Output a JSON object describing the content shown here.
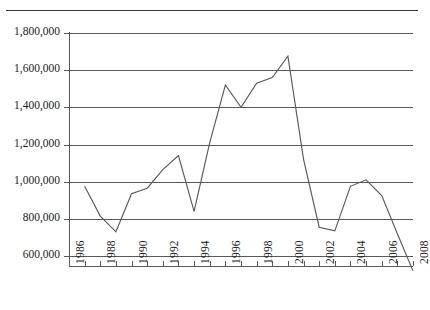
{
  "chart_data": {
    "type": "line",
    "title": "",
    "subtitle": "",
    "xlabel": "",
    "ylabel": "",
    "grid": true,
    "legend": false,
    "legend_position": "none",
    "xlim": [
      1986,
      2008
    ],
    "ylim": [
      450000,
      1800000
    ],
    "x_tick_interval_years": 1,
    "x_label_interval_years": 2,
    "y_tick_labels": [
      "1,800,000",
      "1,600,000",
      "1,400,000",
      "1,200,000",
      "1,000,000",
      "800,000",
      "600,000"
    ],
    "y_tick_values": [
      1800000,
      1600000,
      1400000,
      1200000,
      1000000,
      800000,
      600000
    ],
    "x_tick_labels": [
      "1986",
      "1988",
      "1990",
      "1992",
      "1994",
      "1996",
      "1998",
      "2000",
      "2002",
      "2004",
      "2006",
      "2008"
    ],
    "x_tick_values": [
      1986,
      1988,
      1990,
      1992,
      1994,
      1996,
      1998,
      2000,
      2002,
      2004,
      2006,
      2008
    ],
    "x": [
      1987,
      1988,
      1989,
      1990,
      1991,
      1992,
      1993,
      1994,
      1995,
      1996,
      1997,
      1998,
      1999,
      2000,
      2001,
      2002,
      2003,
      2004,
      2005,
      2006,
      2007,
      2008
    ],
    "values": [
      975000,
      815000,
      730000,
      935000,
      965000,
      1065000,
      1140000,
      840000,
      1210000,
      1520000,
      1400000,
      1530000,
      1560000,
      1675000,
      1120000,
      755000,
      735000,
      975000,
      1010000,
      925000,
      720000,
      520000
    ],
    "series": [
      {
        "name": "",
        "color": "#595959",
        "values": [
          975000,
          815000,
          730000,
          935000,
          965000,
          1065000,
          1140000,
          840000,
          1210000,
          1520000,
          1400000,
          1530000,
          1560000,
          1675000,
          1120000,
          755000,
          735000,
          975000,
          1010000,
          925000,
          720000,
          520000
        ]
      }
    ],
    "annotations": []
  },
  "style": {
    "line_color": "#595959",
    "grid_color": "#595959",
    "axis_color": "#595959",
    "rule_color": "#3a3a3a",
    "text_color": "#1c1c1c",
    "background": "#ffffff"
  }
}
